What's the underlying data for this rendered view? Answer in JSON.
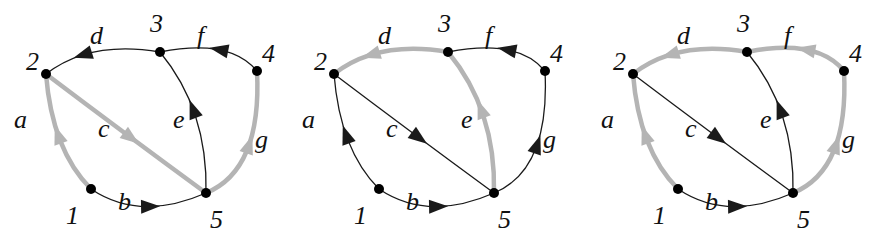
{
  "colors": {
    "normal": "#1a1a1a",
    "highlight": "#b4b4b4",
    "node": "#000000"
  },
  "graphs": [
    {
      "offset_x": 0,
      "nodes": {
        "1": {
          "x": 91,
          "y": 189,
          "lx": 66,
          "ly": 224
        },
        "2": {
          "x": 46,
          "y": 74,
          "lx": 26,
          "ly": 70
        },
        "3": {
          "x": 160,
          "y": 52,
          "lx": 150,
          "ly": 32
        },
        "4": {
          "x": 257,
          "y": 71,
          "lx": 262,
          "ly": 62
        },
        "5": {
          "x": 206,
          "y": 193,
          "lx": 210,
          "ly": 228
        }
      },
      "edges": [
        {
          "name": "a",
          "from": "1",
          "to": "2",
          "highlight": true
        },
        {
          "name": "b",
          "from": "1",
          "to": "5",
          "highlight": false
        },
        {
          "name": "c",
          "from": "2",
          "to": "5",
          "highlight": true
        },
        {
          "name": "d",
          "from": "3",
          "to": "2",
          "highlight": false
        },
        {
          "name": "e",
          "from": "5",
          "to": "3",
          "highlight": false
        },
        {
          "name": "f",
          "from": "4",
          "to": "3",
          "highlight": false
        },
        {
          "name": "g",
          "from": "5",
          "to": "4",
          "highlight": true
        }
      ]
    },
    {
      "offset_x": 288,
      "nodes": {},
      "edges": [
        {
          "name": "a",
          "highlight": false
        },
        {
          "name": "b",
          "highlight": false
        },
        {
          "name": "c",
          "highlight": false
        },
        {
          "name": "d",
          "highlight": true
        },
        {
          "name": "e",
          "highlight": true
        },
        {
          "name": "f",
          "highlight": false
        },
        {
          "name": "g",
          "highlight": false
        }
      ]
    },
    {
      "offset_x": 587,
      "nodes": {},
      "edges": [
        {
          "name": "a",
          "highlight": true
        },
        {
          "name": "b",
          "highlight": false
        },
        {
          "name": "c",
          "highlight": false
        },
        {
          "name": "d",
          "highlight": true
        },
        {
          "name": "e",
          "highlight": false
        },
        {
          "name": "f",
          "highlight": true
        },
        {
          "name": "g",
          "highlight": true
        }
      ]
    }
  ],
  "node_labels": [
    "1",
    "2",
    "3",
    "4",
    "5"
  ],
  "edge_labels": [
    "a",
    "b",
    "c",
    "d",
    "e",
    "f",
    "g"
  ]
}
